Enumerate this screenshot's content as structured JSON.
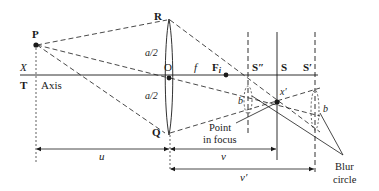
{
  "diagram": {
    "type": "thin-lens depth-of-field / blur circle ray diagram",
    "colors": {
      "ink": "#1a1a1a",
      "background": "#ffffff"
    },
    "points": {
      "P": "P",
      "R": "R",
      "Q": "Q",
      "O": "O",
      "Fi": "F",
      "Fi_sub": "i",
      "S_double_prime": "S″",
      "S": "S",
      "S_prime": "S′",
      "x_prime": "x′",
      "X": "X",
      "T": "T"
    },
    "labels": {
      "axis": "Axis",
      "a_half_top": "a/2",
      "a_half_bottom": "a/2",
      "f": "f",
      "b_left": "b",
      "b_right": "b",
      "point_in_focus_line1": "Point",
      "point_in_focus_line2": "in focus",
      "blur_circle_line1": "Blur",
      "blur_circle_line2": "circle"
    },
    "dimensions": {
      "u": "u",
      "v": "v",
      "v_prime": "v′"
    }
  }
}
